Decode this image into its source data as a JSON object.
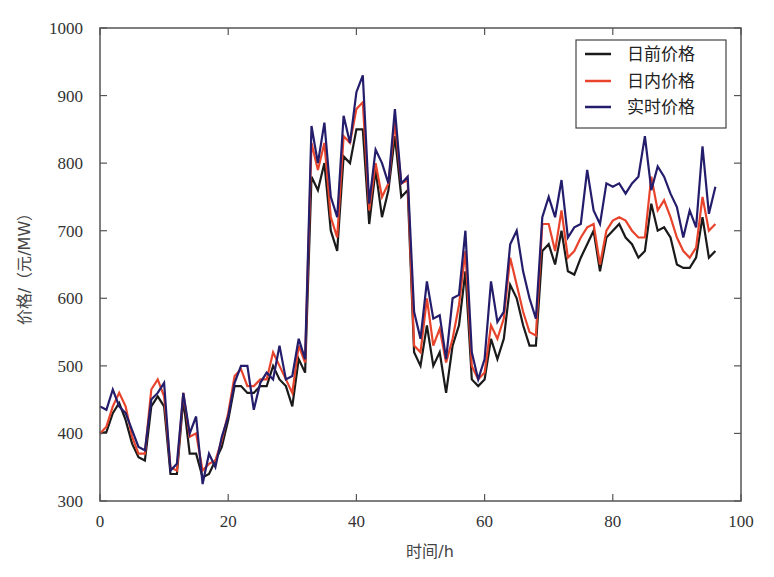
{
  "chart_data": {
    "type": "line",
    "title": "",
    "xlabel": "时间/h",
    "ylabel": "价格/（元/MW）",
    "xlim": [
      0,
      100
    ],
    "ylim": [
      300,
      1000
    ],
    "xticks": [
      0,
      20,
      40,
      60,
      80,
      100
    ],
    "yticks": [
      300,
      400,
      500,
      600,
      700,
      800,
      900,
      1000
    ],
    "grid": false,
    "legend_position": "upper right",
    "x": [
      0,
      1,
      2,
      3,
      4,
      5,
      6,
      7,
      8,
      9,
      10,
      11,
      12,
      13,
      14,
      15,
      16,
      17,
      18,
      19,
      20,
      21,
      22,
      23,
      24,
      25,
      26,
      27,
      28,
      29,
      30,
      31,
      32,
      33,
      34,
      35,
      36,
      37,
      38,
      39,
      40,
      41,
      42,
      43,
      44,
      45,
      46,
      47,
      48,
      49,
      50,
      51,
      52,
      53,
      54,
      55,
      56,
      57,
      58,
      59,
      60,
      61,
      62,
      63,
      64,
      65,
      66,
      67,
      68,
      69,
      70,
      71,
      72,
      73,
      74,
      75,
      76,
      77,
      78,
      79,
      80,
      81,
      82,
      83,
      84,
      85,
      86,
      87,
      88,
      89,
      90,
      91,
      92,
      93,
      94,
      95,
      96
    ],
    "series": [
      {
        "name": "日前价格",
        "color": "#1a1a1a",
        "values": [
          400,
          402,
          430,
          445,
          420,
          385,
          365,
          360,
          440,
          455,
          440,
          340,
          340,
          450,
          370,
          370,
          335,
          340,
          360,
          380,
          420,
          470,
          470,
          460,
          460,
          470,
          470,
          500,
          480,
          470,
          440,
          510,
          490,
          780,
          760,
          800,
          700,
          670,
          810,
          800,
          850,
          850,
          710,
          790,
          720,
          760,
          840,
          750,
          760,
          520,
          500,
          560,
          500,
          520,
          460,
          530,
          560,
          640,
          480,
          470,
          480,
          540,
          510,
          540,
          620,
          600,
          560,
          530,
          530,
          670,
          680,
          650,
          700,
          640,
          635,
          660,
          680,
          700,
          640,
          690,
          700,
          710,
          690,
          680,
          660,
          670,
          740,
          700,
          705,
          690,
          650,
          645,
          645,
          660,
          720,
          660,
          670
        ]
      },
      {
        "name": "日内价格",
        "color": "#e8442c",
        "values": [
          400,
          410,
          440,
          460,
          440,
          395,
          370,
          370,
          465,
          480,
          455,
          350,
          345,
          460,
          395,
          400,
          345,
          355,
          360,
          390,
          430,
          485,
          495,
          470,
          470,
          480,
          480,
          520,
          500,
          480,
          460,
          530,
          505,
          830,
          790,
          830,
          720,
          690,
          840,
          830,
          880,
          890,
          730,
          800,
          750,
          770,
          860,
          770,
          775,
          530,
          520,
          600,
          530,
          555,
          505,
          540,
          590,
          670,
          500,
          480,
          490,
          560,
          540,
          570,
          660,
          620,
          580,
          550,
          545,
          710,
          710,
          670,
          730,
          660,
          670,
          690,
          705,
          710,
          650,
          700,
          715,
          720,
          715,
          700,
          690,
          690,
          780,
          730,
          745,
          720,
          690,
          670,
          660,
          675,
          750,
          700,
          710
        ]
      },
      {
        "name": "实时价格",
        "color": "#241d6b",
        "values": [
          440,
          435,
          465,
          440,
          430,
          405,
          380,
          375,
          450,
          460,
          475,
          345,
          355,
          460,
          400,
          425,
          325,
          370,
          350,
          395,
          425,
          475,
          500,
          500,
          435,
          475,
          490,
          480,
          530,
          480,
          485,
          540,
          510,
          855,
          800,
          860,
          750,
          720,
          870,
          830,
          905,
          930,
          740,
          820,
          800,
          770,
          880,
          770,
          780,
          580,
          540,
          625,
          570,
          575,
          510,
          600,
          605,
          700,
          520,
          480,
          510,
          625,
          565,
          580,
          680,
          700,
          640,
          600,
          570,
          720,
          750,
          720,
          775,
          690,
          705,
          710,
          790,
          730,
          710,
          770,
          765,
          770,
          755,
          770,
          780,
          840,
          760,
          795,
          780,
          755,
          735,
          690,
          730,
          705,
          825,
          725,
          765
        ]
      }
    ]
  },
  "legend": {
    "items": [
      "日前价格",
      "日内价格",
      "实时价格"
    ]
  },
  "axes": {
    "x_label": "时间/h",
    "y_label": "价格/（元/MW）",
    "x_tick_labels": [
      "0",
      "20",
      "40",
      "60",
      "80",
      "100"
    ],
    "y_tick_labels": [
      "300",
      "400",
      "500",
      "600",
      "700",
      "800",
      "900",
      "1000"
    ]
  }
}
